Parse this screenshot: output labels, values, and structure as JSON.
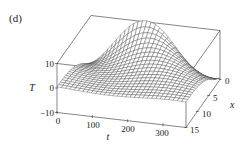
{
  "panel_label": "(d)",
  "axes": {
    "t": {
      "label": "t",
      "ticks": [
        "0",
        "100",
        "200",
        "300"
      ],
      "range": [
        0,
        365
      ]
    },
    "x": {
      "label": "x",
      "ticks": [
        "0",
        "5",
        "10",
        "15"
      ],
      "range": [
        0,
        15
      ]
    },
    "T": {
      "label": "T",
      "ticks": [
        "10",
        "0",
        "−10"
      ],
      "range": [
        -10,
        10
      ]
    }
  },
  "chart_data": {
    "type": "surface",
    "title": "(d)",
    "xlabel": "t",
    "ylabel": "x",
    "zlabel": "T",
    "t_range": [
      0,
      365
    ],
    "x_range": [
      0,
      15
    ],
    "T_range": [
      -10,
      10
    ],
    "t_ticks": [
      0,
      100,
      200,
      300
    ],
    "x_ticks": [
      0,
      5,
      10,
      15
    ],
    "T_ticks": [
      -10,
      0,
      10
    ],
    "model": "T(x,t) = A·e^(-λx)·sin(ωt − λx − φ), damped temperature wave",
    "params": {
      "A": 10.5,
      "lambda": 0.2,
      "omega": 0.01721,
      "phi": 1.1
    },
    "features": "Peak of about 10 near t≈150 at x=0; trough near t≈330 at x=0; amplitude decays toward x=15 where surface is nearly flat near T≈0"
  },
  "style": {
    "line_color": "#222222",
    "mesh_color": "#333333",
    "surface_fill": "#ffffff"
  }
}
